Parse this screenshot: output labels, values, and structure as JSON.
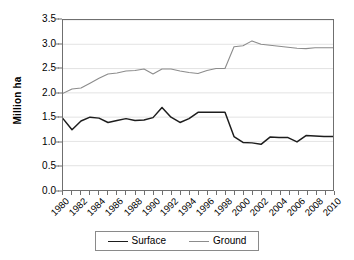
{
  "chart_data": {
    "type": "line",
    "title": "",
    "xlabel": "",
    "ylabel": "Million ha",
    "ylim": [
      0.0,
      3.5
    ],
    "xlim": [
      1980,
      2010
    ],
    "grid": true,
    "grid_axis": "y",
    "legend_position": "bottom",
    "ytick_labels": [
      "0.0",
      "0.5",
      "1.0",
      "1.5",
      "2.0",
      "2.5",
      "3.0",
      "3.5"
    ],
    "ytick_values": [
      0.0,
      0.5,
      1.0,
      1.5,
      2.0,
      2.5,
      3.0,
      3.5
    ],
    "x": [
      1980,
      1981,
      1982,
      1983,
      1984,
      1985,
      1986,
      1987,
      1988,
      1989,
      1990,
      1991,
      1992,
      1993,
      1994,
      1995,
      1996,
      1997,
      1998,
      1999,
      2000,
      2001,
      2002,
      2003,
      2004,
      2005,
      2006,
      2007,
      2008,
      2009,
      2010
    ],
    "xtick_labels": [
      "1980",
      "1982",
      "1984",
      "1986",
      "1988",
      "1990",
      "1992",
      "1994",
      "1996",
      "1998",
      "2000",
      "2002",
      "2004",
      "2006",
      "2008",
      "2010"
    ],
    "xtick_values": [
      1980,
      1982,
      1984,
      1986,
      1988,
      1990,
      1992,
      1994,
      1996,
      1998,
      2000,
      2002,
      2004,
      2006,
      2008,
      2010
    ],
    "series": [
      {
        "name": "Surface",
        "color": "#1d1d1d",
        "values": [
          1.47,
          1.24,
          1.42,
          1.5,
          1.48,
          1.39,
          1.43,
          1.47,
          1.43,
          1.44,
          1.49,
          1.7,
          1.5,
          1.39,
          1.47,
          1.6,
          1.6,
          1.6,
          1.6,
          1.1,
          0.98,
          0.97,
          0.94,
          1.09,
          1.08,
          1.08,
          0.99,
          1.12,
          1.11,
          1.1,
          1.1
        ]
      },
      {
        "name": "Ground",
        "color": "#8c8c8c",
        "values": [
          1.99,
          2.08,
          2.1,
          2.2,
          2.3,
          2.39,
          2.41,
          2.45,
          2.46,
          2.49,
          2.39,
          2.49,
          2.49,
          2.45,
          2.42,
          2.4,
          2.46,
          2.5,
          2.5,
          2.95,
          2.97,
          3.07,
          3.0,
          2.98,
          2.96,
          2.94,
          2.92,
          2.91,
          2.93,
          2.93,
          2.93
        ]
      }
    ]
  },
  "legend": {
    "items": [
      {
        "label": "Surface",
        "color": "#1d1d1d"
      },
      {
        "label": "Ground",
        "color": "#8c8c8c"
      }
    ]
  },
  "axes": {
    "y_title": "Million ha"
  }
}
